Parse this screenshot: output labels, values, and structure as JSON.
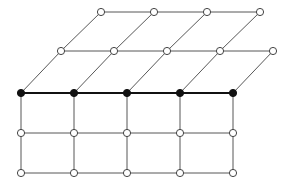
{
  "diagram": {
    "type": "lattice-graph",
    "colors": {
      "background": "#ffffff",
      "line": "#444444",
      "filled": "#111111"
    },
    "node_radius": 3.6,
    "rows": [
      {
        "id": "top",
        "y": 12,
        "x": [
          101,
          154,
          207,
          260
        ],
        "style": "open"
      },
      {
        "id": "middle",
        "y": 51,
        "x": [
          61,
          114,
          167,
          220,
          273
        ],
        "style": "open"
      },
      {
        "id": "highlighted",
        "y": 93,
        "x": [
          21,
          74,
          127,
          180,
          233
        ],
        "style": "filled"
      },
      {
        "id": "lower",
        "y": 133,
        "x": [
          21,
          74,
          127,
          180,
          233
        ],
        "style": "open"
      },
      {
        "id": "bottom",
        "y": 173,
        "x": [
          21,
          74,
          127,
          180,
          233
        ],
        "style": "open"
      }
    ],
    "horizontal_edges": [
      {
        "row": "top",
        "style": "thin"
      },
      {
        "row": "middle",
        "style": "thin"
      },
      {
        "row": "highlighted",
        "style": "thick"
      },
      {
        "row": "lower",
        "style": "thin"
      },
      {
        "row": "bottom",
        "style": "thin"
      }
    ],
    "connections": [
      {
        "from": "top",
        "to": "middle",
        "pairs": [
          [
            0,
            0
          ],
          [
            1,
            1
          ],
          [
            2,
            2
          ],
          [
            3,
            3
          ]
        ]
      },
      {
        "from": "middle",
        "to": "highlighted",
        "pairs": [
          [
            0,
            0
          ],
          [
            1,
            1
          ],
          [
            2,
            2
          ],
          [
            3,
            3
          ],
          [
            4,
            4
          ]
        ]
      },
      {
        "from": "highlighted",
        "to": "lower",
        "pairs": [
          [
            0,
            0
          ],
          [
            1,
            1
          ],
          [
            2,
            2
          ],
          [
            3,
            3
          ],
          [
            4,
            4
          ]
        ]
      },
      {
        "from": "lower",
        "to": "bottom",
        "pairs": [
          [
            0,
            0
          ],
          [
            1,
            1
          ],
          [
            2,
            2
          ],
          [
            3,
            3
          ],
          [
            4,
            4
          ]
        ]
      }
    ]
  }
}
